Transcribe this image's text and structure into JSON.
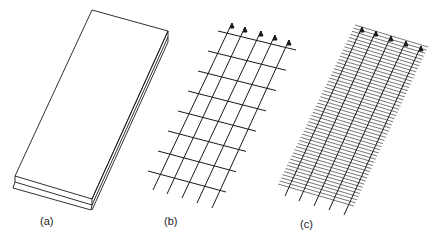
{
  "figure": {
    "panels": [
      {
        "id": "a",
        "label": "(a)",
        "description": "solid slab"
      },
      {
        "id": "b",
        "label": "(b)",
        "description": "coarse grid with arrows"
      },
      {
        "id": "c",
        "label": "(c)",
        "description": "dense hatched grid with arrows"
      }
    ],
    "colors": {
      "line": "#1a1a1a",
      "background": "#ffffff"
    }
  }
}
